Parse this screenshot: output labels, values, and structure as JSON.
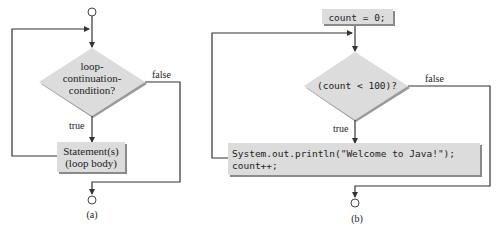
{
  "diagram_a": {
    "condition": [
      "loop-",
      "continuation-",
      "condition?"
    ],
    "false_label": "false",
    "true_label": "true",
    "body": [
      "Statement(s)",
      "(loop body)"
    ],
    "caption": "(a)"
  },
  "diagram_b": {
    "init": "count = 0;",
    "condition": "(count < 100)?",
    "false_label": "false",
    "true_label": "true",
    "body": [
      "System.out.println(\"Welcome to Java!\");",
      "count++;"
    ],
    "caption": "(b)"
  },
  "colors": {
    "shape_fill": "#dcdcdc",
    "shadow": "#8a8a8a",
    "line": "#333333",
    "text": "#222222"
  }
}
